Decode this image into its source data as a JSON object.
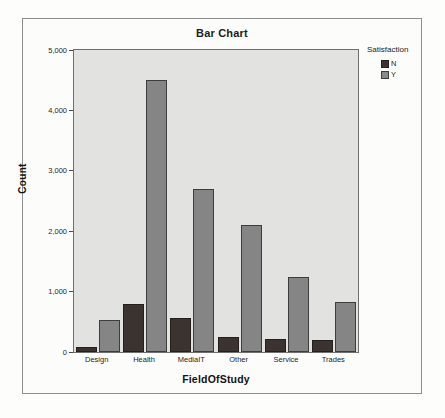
{
  "chart_data": {
    "type": "bar",
    "title": "Bar Chart",
    "xlabel": "FieldOfStudy",
    "ylabel": "Count",
    "categories": [
      "Design",
      "Health",
      "MediaIT",
      "Other",
      "Service",
      "Trades"
    ],
    "series": [
      {
        "name": "N",
        "color": "#3b3330",
        "values": [
          90,
          800,
          560,
          250,
          215,
          195
        ]
      },
      {
        "name": "Y",
        "color": "#858585",
        "values": [
          530,
          4500,
          2700,
          2100,
          1240,
          830
        ]
      }
    ],
    "legend": {
      "title": "Satisfaction",
      "position": "right",
      "entries": [
        "N",
        "Y"
      ]
    },
    "ylim": [
      0,
      5000
    ],
    "yticks": [
      0,
      1000,
      2000,
      3000,
      4000,
      5000
    ],
    "ytick_labels": [
      "0",
      "1,000",
      "2,000",
      "3,000",
      "4,000",
      "5,000"
    ],
    "grid": false,
    "plot_background": "#e2e2e0"
  }
}
